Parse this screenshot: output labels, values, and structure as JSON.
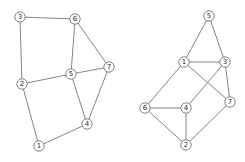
{
  "figure": {
    "width": 245,
    "height": 162,
    "background": "#ffffff",
    "edge_color": "#767676",
    "edge_width": 0.9,
    "node_fill": "#ffffff",
    "node_stroke": "#767676",
    "node_stroke_width": 0.9,
    "node_radius": 5.2,
    "label_color": "#2b2b2b"
  },
  "graphs": [
    {
      "name": "left-graph",
      "nodes": [
        {
          "id": "1",
          "x": 39,
          "y": 146
        },
        {
          "id": "2",
          "x": 22,
          "y": 84
        },
        {
          "id": "3",
          "x": 20,
          "y": 17
        },
        {
          "id": "4",
          "x": 87,
          "y": 124
        },
        {
          "id": "5",
          "x": 71,
          "y": 74
        },
        {
          "id": "6",
          "x": 75,
          "y": 19
        },
        {
          "id": "7",
          "x": 109,
          "y": 67
        }
      ],
      "edges": [
        [
          "3",
          "6"
        ],
        [
          "2",
          "3"
        ],
        [
          "2",
          "5"
        ],
        [
          "1",
          "2"
        ],
        [
          "5",
          "6"
        ],
        [
          "6",
          "7"
        ],
        [
          "5",
          "7"
        ],
        [
          "4",
          "5"
        ],
        [
          "4",
          "7"
        ],
        [
          "1",
          "4"
        ]
      ]
    },
    {
      "name": "right-graph",
      "nodes": [
        {
          "id": "1",
          "x": 184,
          "y": 62
        },
        {
          "id": "2",
          "x": 186,
          "y": 145
        },
        {
          "id": "3",
          "x": 225,
          "y": 62
        },
        {
          "id": "4",
          "x": 186,
          "y": 108
        },
        {
          "id": "5",
          "x": 209,
          "y": 16
        },
        {
          "id": "6",
          "x": 145,
          "y": 108
        },
        {
          "id": "7",
          "x": 230,
          "y": 102
        }
      ],
      "edges": [
        [
          "1",
          "5"
        ],
        [
          "3",
          "5"
        ],
        [
          "1",
          "3"
        ],
        [
          "1",
          "6"
        ],
        [
          "1",
          "7"
        ],
        [
          "3",
          "4"
        ],
        [
          "3",
          "7"
        ],
        [
          "4",
          "6"
        ],
        [
          "2",
          "6"
        ],
        [
          "2",
          "4"
        ],
        [
          "2",
          "7"
        ]
      ]
    }
  ]
}
